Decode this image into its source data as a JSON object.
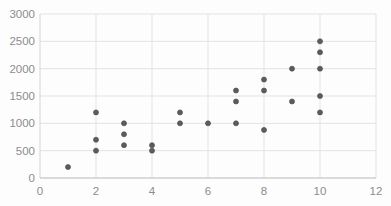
{
  "chart_data": {
    "type": "scatter",
    "title": "",
    "xlabel": "",
    "ylabel": "",
    "xlim": [
      0,
      12
    ],
    "ylim": [
      0,
      3000
    ],
    "xticks": [
      0,
      2,
      4,
      6,
      8,
      10,
      12
    ],
    "yticks": [
      0,
      500,
      1000,
      1500,
      2000,
      2500,
      3000
    ],
    "grid": true,
    "legend_position": "none",
    "series": [
      {
        "name": "Series1",
        "marker": "circle",
        "color": "#595959",
        "points": [
          {
            "x": 1,
            "y": 200
          },
          {
            "x": 2,
            "y": 500
          },
          {
            "x": 2,
            "y": 700
          },
          {
            "x": 2,
            "y": 1200
          },
          {
            "x": 3,
            "y": 600
          },
          {
            "x": 3,
            "y": 800
          },
          {
            "x": 3,
            "y": 1000
          },
          {
            "x": 4,
            "y": 500
          },
          {
            "x": 4,
            "y": 600
          },
          {
            "x": 5,
            "y": 1000
          },
          {
            "x": 5,
            "y": 1200
          },
          {
            "x": 6,
            "y": 1000
          },
          {
            "x": 7,
            "y": 1000
          },
          {
            "x": 7,
            "y": 1400
          },
          {
            "x": 7,
            "y": 1600
          },
          {
            "x": 8,
            "y": 880
          },
          {
            "x": 8,
            "y": 1600
          },
          {
            "x": 8,
            "y": 1800
          },
          {
            "x": 9,
            "y": 1400
          },
          {
            "x": 9,
            "y": 2000
          },
          {
            "x": 10,
            "y": 1200
          },
          {
            "x": 10,
            "y": 1500
          },
          {
            "x": 10,
            "y": 2000
          },
          {
            "x": 10,
            "y": 2300
          },
          {
            "x": 10,
            "y": 2500
          }
        ]
      }
    ],
    "colors": {
      "background": "#fdfdfd",
      "gridline": "#e3e3e3",
      "y_axis_line": "#d5d5d5",
      "x_axis_line": "#b8b8b8",
      "tick_label": "#8c8c8c",
      "marker_fill": "#5c5c5c",
      "marker_edge": "#4d4d4d"
    }
  }
}
